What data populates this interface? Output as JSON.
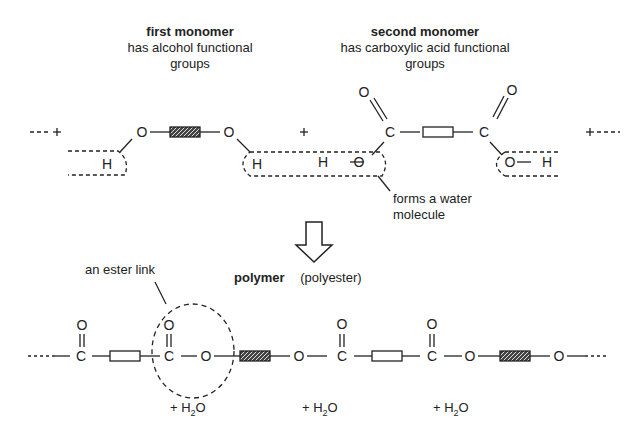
{
  "monomers": {
    "first": {
      "title": "first monomer",
      "desc_line1": "has alcohol functional",
      "desc_line2": "groups"
    },
    "second": {
      "title": "second monomer",
      "desc_line1": "has carboxylic acid functional",
      "desc_line2": "groups"
    }
  },
  "reactant_chain": {
    "lead": "- - - +",
    "plus_middle": "+",
    "tail": "+ - - -",
    "atoms": {
      "o1": "O",
      "o2": "O",
      "h1": "H",
      "h2": "H",
      "h3": "H",
      "o3": "O",
      "c1": "C",
      "c2": "C",
      "o_top1": "O",
      "o_top2": "O",
      "o4": "O",
      "h4": "H"
    }
  },
  "annotations": {
    "water_line1": "forms a water",
    "water_line2": "molecule",
    "ester_link": "an ester link"
  },
  "arrow": {
    "icon": "down-arrow-icon"
  },
  "polymer": {
    "title": "polymer",
    "subtitle": "(polyester)",
    "atoms": {
      "c1": "C",
      "c1_top": "O",
      "c2": "C",
      "c2_top": "O",
      "o1": "O",
      "o2": "O",
      "c3": "C",
      "c3_top": "O",
      "c4": "C",
      "c4_top": "O",
      "o3": "O",
      "o4": "O"
    }
  },
  "byproducts": [
    {
      "plus": "+ H",
      "sub": "2",
      "tail": "O"
    },
    {
      "plus": "+ H",
      "sub": "2",
      "tail": "O"
    },
    {
      "plus": "+ H",
      "sub": "2",
      "tail": "O"
    }
  ]
}
